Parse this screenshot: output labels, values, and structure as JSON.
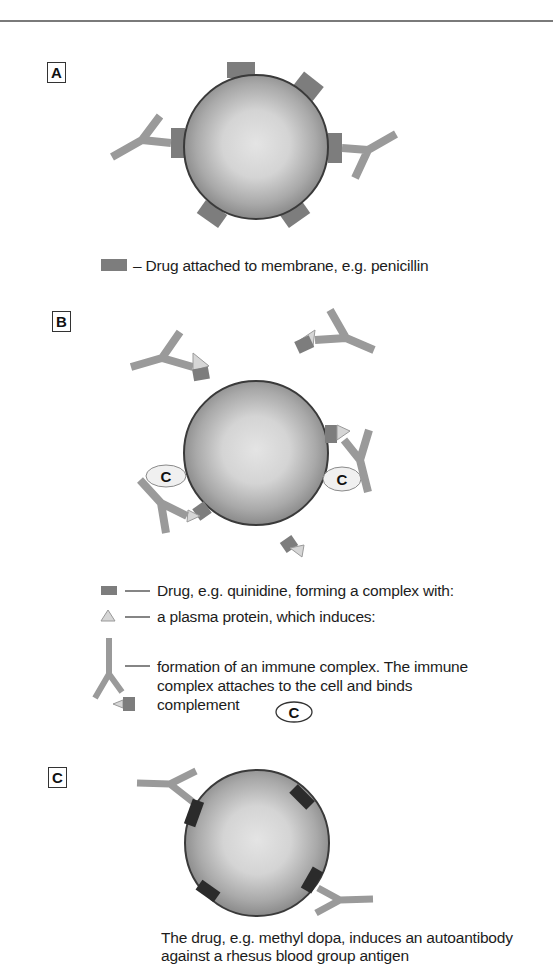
{
  "figure": {
    "colors": {
      "drug": "#7d7d7d",
      "antibody": "#9a9a9a",
      "plasma_protein": "#d6d6d6",
      "autoantibody_binding_site": "#2b2b2b",
      "cell_edge": "#3a3a3a",
      "cell_center": "#e2e2e2",
      "cell_rim": "#8e8e8e"
    },
    "panels": [
      {
        "label": "A",
        "legend": [
          {
            "symbol": "drug-rectangle",
            "text": "– Drug attached to membrane, e.g. penicillin"
          }
        ]
      },
      {
        "label": "B",
        "complement_symbol": "C",
        "legend": [
          {
            "symbol": "drug-rectangle",
            "text": "Drug, e.g. quinidine, forming a complex with:"
          },
          {
            "symbol": "plasma-protein-triangle",
            "text": "a plasma protein, which induces:"
          },
          {
            "symbol": "immune-complex",
            "lines": [
              "formation of an immune complex. The immune",
              "complex attaches to the cell and binds",
              "complement"
            ]
          }
        ],
        "complement_legend_symbol": "C"
      },
      {
        "label": "C",
        "caption": [
          "The drug, e.g. methyl dopa, induces an autoantibody",
          "against a rhesus blood group antigen"
        ]
      }
    ]
  }
}
